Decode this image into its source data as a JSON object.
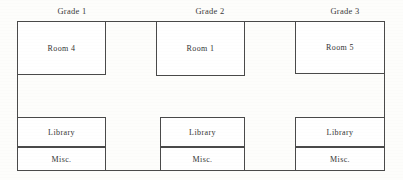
{
  "diagram": {
    "type": "floor-plan",
    "line_color": "#4a4a4a",
    "background_color": "#fdfdfb",
    "building": {
      "x": 17,
      "y": 21,
      "width": 368,
      "height": 150
    },
    "grade_labels": [
      {
        "text": "Grade 1",
        "center_x": 72,
        "y": 6
      },
      {
        "text": "Grade 2",
        "center_x": 210,
        "y": 6
      },
      {
        "text": "Grade 3",
        "center_x": 345,
        "y": 6
      }
    ],
    "zones": [
      {
        "label": "Room 4",
        "x": 17,
        "y": 21,
        "width": 89,
        "height": 54
      },
      {
        "label": "Room 1",
        "x": 156,
        "y": 21,
        "width": 89,
        "height": 55
      },
      {
        "label": "Room 5",
        "x": 295,
        "y": 21,
        "width": 90,
        "height": 53
      },
      {
        "label": "Library",
        "x": 17,
        "y": 117,
        "width": 89,
        "height": 30
      },
      {
        "label": "Library",
        "x": 160,
        "y": 117,
        "width": 85,
        "height": 30
      },
      {
        "label": "Library",
        "x": 295,
        "y": 117,
        "width": 90,
        "height": 30
      },
      {
        "label": "Misc.",
        "x": 17,
        "y": 147,
        "width": 89,
        "height": 24
      },
      {
        "label": "Misc.",
        "x": 160,
        "y": 147,
        "width": 85,
        "height": 24
      },
      {
        "label": "Misc.",
        "x": 295,
        "y": 147,
        "width": 90,
        "height": 24
      }
    ]
  }
}
